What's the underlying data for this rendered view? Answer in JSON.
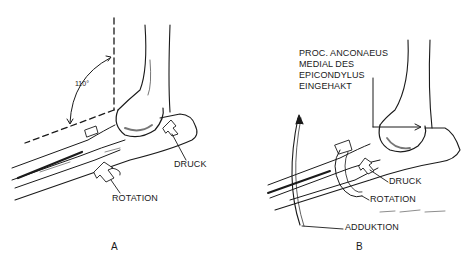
{
  "figure": {
    "panels": [
      {
        "id": "A",
        "label": "A",
        "angle_label": "110°",
        "annotations": {
          "pressure": "DRUCK",
          "rotation": "ROTATION"
        }
      },
      {
        "id": "B",
        "label": "B",
        "callout": [
          "PROC. ANCONAEUS",
          "MEDIAL DES",
          "EPICONDYLUS",
          "EINGEHAKT"
        ],
        "annotations": {
          "pressure": "DRUCK",
          "rotation": "ROTATION",
          "adduction": "ADDUKTION"
        }
      }
    ],
    "colors": {
      "ink": "#1a1a1a",
      "background": "#ffffff"
    }
  }
}
